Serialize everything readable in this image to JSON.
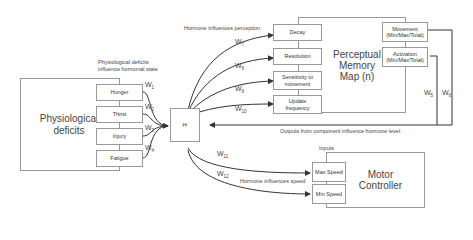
{
  "physiological": {
    "title": "Physiological deficits",
    "caption_line1": "Physiological deficits",
    "caption_line2": "influence hormonal state",
    "items": [
      "Hunger",
      "Thirst",
      "Injury",
      "Fatigue"
    ],
    "weights": [
      "W1",
      "W2",
      "W3",
      "W4"
    ]
  },
  "hormone": {
    "label": "H",
    "sub": "i"
  },
  "perception": {
    "caption": "Hormone influences perception",
    "title_line1": "Perceptual",
    "title_line2": "Memory",
    "title_line3": "Map (n)",
    "items": [
      "Decay",
      "Resolution",
      "Sensitivity to movement",
      "Update frequency"
    ],
    "weights": [
      "W7",
      "W8",
      "W9",
      "W10"
    ],
    "outputs": [
      "Movement (Min/Max/Total)",
      "Activation (Min/Max/Total)"
    ],
    "output_weights": [
      "W5",
      "W6"
    ],
    "feedback_caption": "Outputs from component influence hormone level"
  },
  "motor": {
    "title_line1": "Motor",
    "title_line2": "Controller",
    "inputs_caption": "Inputs",
    "speed_caption": "Hormone influences speed",
    "items": [
      "Max Speed",
      "Min Speed"
    ],
    "weights": [
      "W11",
      "W12"
    ]
  },
  "colors": {
    "line": "#333333",
    "box_border": "#999999",
    "text": "#444444"
  }
}
